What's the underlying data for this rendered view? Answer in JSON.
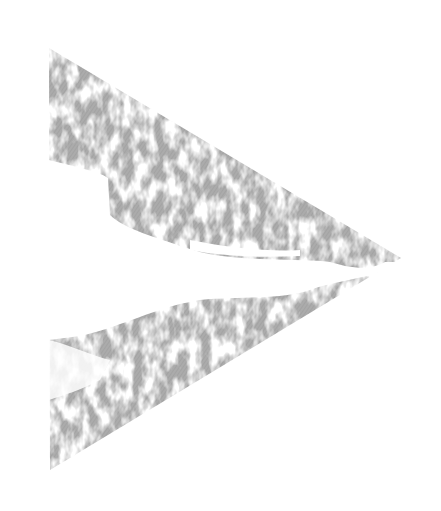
{
  "image": {
    "description": "Distressed grey right-pointing triangle (play-style arrow) on white background",
    "shape": "triangle-right",
    "vertices": {
      "top_left": [
        49,
        48
      ],
      "right": [
        401,
        258
      ],
      "bottom_left": [
        50,
        470
      ]
    },
    "colors": {
      "background": "#ffffff",
      "fill": "#aaaaaa",
      "hatch": "#9c9c9c"
    },
    "texture": "grunge-hatch"
  }
}
